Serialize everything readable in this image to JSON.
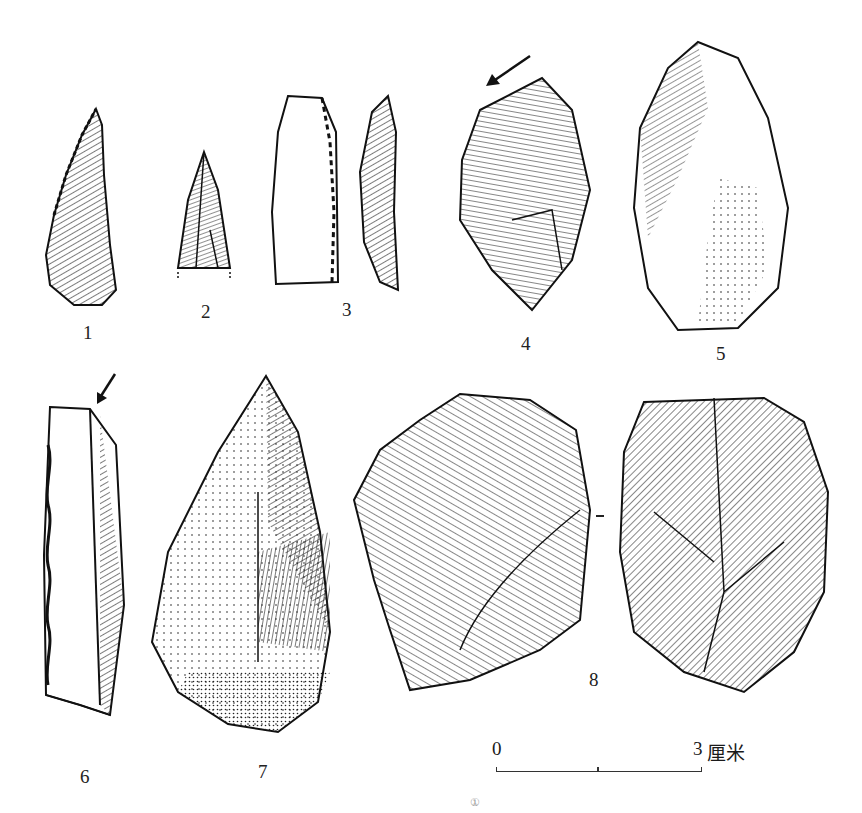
{
  "figure": {
    "items": [
      {
        "id": 1,
        "label": "1"
      },
      {
        "id": 2,
        "label": "2"
      },
      {
        "id": 3,
        "label": "3"
      },
      {
        "id": 4,
        "label": "4"
      },
      {
        "id": 5,
        "label": "5"
      },
      {
        "id": 6,
        "label": "6"
      },
      {
        "id": 7,
        "label": "7"
      },
      {
        "id": 8,
        "label": "8"
      }
    ],
    "scale_bar": {
      "start_label": "0",
      "end_label": "3",
      "unit": "厘米"
    },
    "caption": {
      "text": "",
      "footnote_marker": "①"
    },
    "colors": {
      "ink": "#1a1a1a",
      "background": "#ffffff"
    }
  }
}
